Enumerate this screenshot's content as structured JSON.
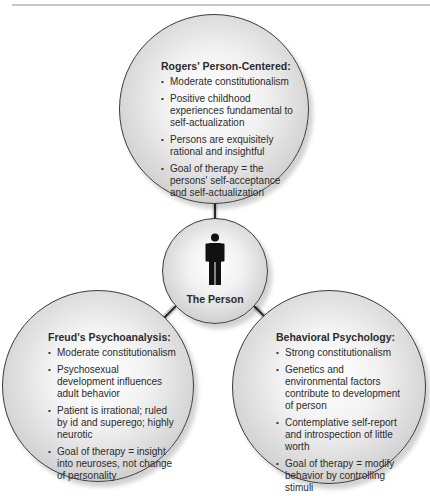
{
  "diagram": {
    "center": {
      "label": "The Person",
      "icon": "person-icon"
    },
    "nodes": [
      {
        "id": "rogers",
        "position": "top",
        "heading": "Rogers' Person-Centered:",
        "items": [
          "Moderate constitutionalism",
          "Positive childhood experiences fundamental to self-actualization",
          "Persons are exquisitely rational and insightful",
          "Goal of therapy = the persons' self-acceptance and self-actualization"
        ]
      },
      {
        "id": "freud",
        "position": "bottom-left",
        "heading": "Freud's Psychoanalysis:",
        "items": [
          "Moderate constitutionalism",
          "Psychosexual development influences adult behavior",
          "Patient is irrational; ruled by id and superego; highly neurotic",
          "Goal of therapy = insight into neuroses, not change of personality"
        ]
      },
      {
        "id": "behavioral",
        "position": "bottom-right",
        "heading": "Behavioral Psychology:",
        "items": [
          "Strong constitutionalism",
          "Genetics and environmental factors contribute to development of person",
          "Contemplative self-report and introspection of little worth",
          "Goal of therapy = modify behavior by controlling stimuli"
        ]
      }
    ],
    "colors": {
      "line": "#2a2a2a",
      "text": "#2b2b2b",
      "circle_edge": "#3a3a3a"
    }
  }
}
